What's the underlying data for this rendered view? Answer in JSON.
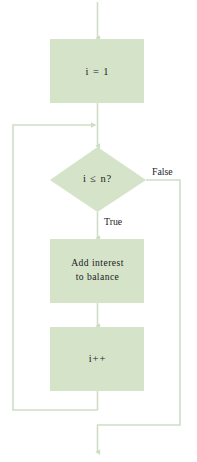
{
  "diagram": {
    "type": "flowchart",
    "colors": {
      "node_fill": "#d5e3c8",
      "connector": "#cfddc6",
      "text": "#20201e",
      "background": "#ffffff"
    },
    "nodes": [
      {
        "id": "init",
        "shape": "rectangle",
        "lines": [
          "i = 1"
        ],
        "text_style": "code"
      },
      {
        "id": "condition",
        "shape": "diamond",
        "lines": [
          "i ≤ n?"
        ],
        "text_style": "code"
      },
      {
        "id": "body",
        "shape": "rectangle",
        "lines": [
          "Add interest",
          "to balance"
        ],
        "text_style": "phrase"
      },
      {
        "id": "increment",
        "shape": "rectangle",
        "lines": [
          "i++"
        ],
        "text_style": "code"
      }
    ],
    "edge_labels": {
      "false_branch": "False",
      "true_branch": "True"
    }
  }
}
